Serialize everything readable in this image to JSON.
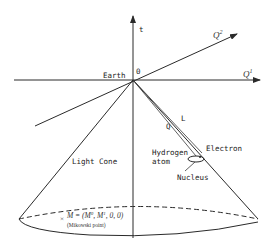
{
  "diagram": {
    "type": "spacetime light cone diagram",
    "axes": {
      "time_label": "t",
      "q1_label": "Q",
      "q1_superscript": "1",
      "q2_label": "Q",
      "q2_superscript": "2"
    },
    "origin": {
      "label": "0",
      "place_label": "Earth"
    },
    "rays": {
      "outer_label": "L",
      "inner_label": "Q"
    },
    "atom": {
      "name_line1": "Hydrogen",
      "name_line2": "atom",
      "electron_label": "Electron",
      "nucleus_label": "Nucleus"
    },
    "cone": {
      "label": "Light Cone"
    },
    "point": {
      "marker": "×",
      "formula_prefix": "M = (M",
      "sup0": "0",
      "mid": ", M",
      "sup1": "1",
      "suffix": ", 0, 0)",
      "caption": "(Mikowski point)"
    },
    "colors": {
      "ink": "#2a2a2a",
      "background": "#ffffff"
    }
  }
}
